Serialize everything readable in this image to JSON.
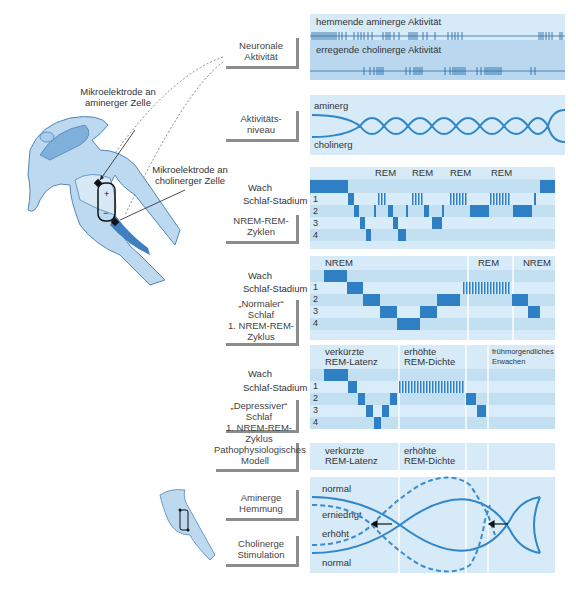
{
  "colors": {
    "accent": "#2f86c8",
    "panel_light": "#d6eaf8",
    "panel_mid": "#b9d8ef",
    "frame_gray": "#8c8c8c"
  },
  "illustration": {
    "label_aminergic": [
      "Mikroelektrode an",
      "aminerger Zelle"
    ],
    "label_cholinergic": [
      "Mikroelektrode an",
      "cholinerger Zelle"
    ],
    "plus": "+",
    "minus": "−"
  },
  "labels": {
    "neuronal": [
      "Neuronale",
      "Aktivität"
    ],
    "activity_level": [
      "Aktivitäts-",
      "niveau"
    ],
    "cycles": [
      "NREM-REM-",
      "Zyklen"
    ],
    "normal": [
      "„Normaler“",
      "Schlaf",
      "1. NREM-REM-",
      "Zyklus"
    ],
    "depressive": [
      "„Depressiver“ Schlaf",
      "1. NREM-REM-",
      "Zyklus"
    ],
    "patho": [
      "Pathophysiologisches",
      "Modell"
    ],
    "aminergic_inhibition": [
      "Aminerge",
      "Hemmung"
    ],
    "cholinergic_stimulation": [
      "Cholinerge",
      "Stimulation"
    ]
  },
  "neuronal_panel": {
    "top": "hemmende aminerge Aktivität",
    "bottom": "erregende cholinerge Aktivität"
  },
  "activity_panel": {
    "top": "aminerg",
    "bottom": "cholinerg"
  },
  "hypnogram": {
    "wach": "Wach",
    "stadium": "Schlaf-Stadium",
    "stages": [
      "1",
      "2",
      "3",
      "4"
    ]
  },
  "cycles_panel": {
    "rem_labels": [
      "REM",
      "REM",
      "REM",
      "REM"
    ]
  },
  "normal_panel": {
    "headers": [
      "NREM",
      "REM",
      "NREM"
    ]
  },
  "depressive_panel": {
    "headers": [
      [
        "verkürzte",
        "REM-Latenz"
      ],
      [
        "erhöhte",
        "REM-Dichte"
      ],
      [
        "frühmorgendliches",
        "Erwachen"
      ]
    ]
  },
  "patho_panel": {
    "headers": [
      [
        "verkürzte",
        "REM-Latenz"
      ],
      [
        "erhöhte",
        "REM-Dichte"
      ]
    ]
  },
  "model_panel": {
    "normal_top": "normal",
    "decreased": "erniedrigt",
    "increased": "erhöht",
    "normal_bottom": "normal"
  }
}
